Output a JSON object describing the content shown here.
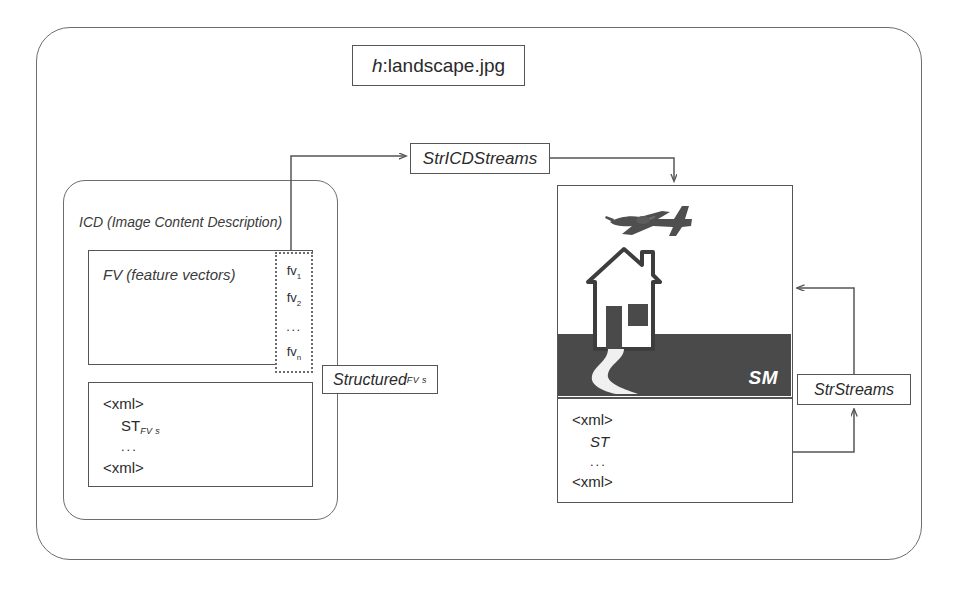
{
  "diagram": {
    "title_box": {
      "symbol": "h",
      "separator": ": ",
      "filename": "landscape.jpg"
    },
    "containers": {
      "outer_label": "",
      "icd_label": "ICD (Image Content Description)"
    },
    "nodes": {
      "str_icd_streams": "StrICDStreams",
      "str_streams": "StrStreams",
      "structured": {
        "base": "Structured",
        "subscript": "FV s"
      }
    },
    "fv_block": {
      "label": "FV (feature vectors)",
      "items": [
        {
          "base": "fv",
          "sub": "1"
        },
        {
          "base": "fv",
          "sub": "2"
        },
        {
          "base": "fv",
          "sub": "n"
        }
      ],
      "ellipsis": "..."
    },
    "icd_xml": {
      "open_tag": "<xml>",
      "content": "ST",
      "content_subscript": "FV s",
      "ellipsis": "...",
      "close_tag": "<xml>"
    },
    "sm_xml": {
      "open_tag": "<xml>",
      "content": "ST",
      "ellipsis": "...",
      "close_tag": "<xml>"
    },
    "sm_panel": {
      "caption": "SM",
      "scene_objects": [
        "airplane",
        "house",
        "path",
        "ground"
      ]
    },
    "colors": {
      "outline": "#555555",
      "container_outline": "#6d6d6d",
      "ground": "#4a4a4a",
      "plane": "#4f4f4f",
      "house_outline": "#3d3d3d",
      "house_fill": "#ffffff",
      "path": "#f0f0f0",
      "caption_text": "#ffffff",
      "background": "#ffffff"
    }
  }
}
